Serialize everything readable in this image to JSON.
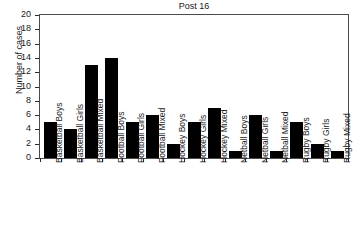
{
  "chart_data": {
    "type": "bar",
    "title": "Post 16",
    "xlabel": "",
    "ylabel": "Number of cases",
    "categories": [
      "Basketball Boys",
      "Basketball Girls",
      "Basketball Mixed",
      "Football Boys",
      "Football Girls",
      "Football Mixed",
      "Hockey Boys",
      "Hockey Girls",
      "Hockey Mixed",
      "Netball Boys",
      "Netball Girls",
      "Netball Mixed",
      "Rugby Boys",
      "Rugby Girls",
      "Rugby Mixed"
    ],
    "values": [
      5,
      4,
      13,
      14,
      5,
      6,
      2,
      5,
      7,
      1,
      6,
      1,
      5,
      2,
      1
    ],
    "ylim": [
      0,
      20
    ],
    "ytick_values": [
      0,
      2,
      4,
      6,
      8,
      10,
      12,
      14,
      16,
      18,
      20
    ],
    "ytick_labels": [
      "0",
      "2",
      "4",
      "6",
      "8",
      "10",
      "12",
      "14",
      "16",
      "18",
      "20"
    ],
    "grid": false,
    "legend": null,
    "bar_color": "#000000",
    "axis_color": "#4a4a4a",
    "background_color": "#ffffff"
  }
}
